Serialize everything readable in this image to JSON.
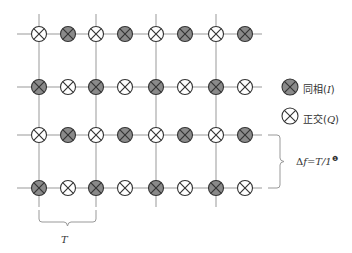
{
  "diagram": {
    "grid": {
      "row_y": [
        34,
        87,
        135,
        188
      ],
      "col_x": [
        39,
        68,
        96,
        125,
        156,
        185,
        216,
        245
      ],
      "vertical_line_x": [
        39,
        96,
        156,
        216
      ],
      "h_line_start": 17,
      "h_line_end": 262,
      "v_line_top": 14,
      "v_line_bottom": 207,
      "symbol_radius": 7.5,
      "rows": [
        [
          "Q",
          "I",
          "Q",
          "I",
          "Q",
          "I",
          "Q",
          "I"
        ],
        [
          "I",
          "Q",
          "I",
          "Q",
          "I",
          "Q",
          "I",
          "Q"
        ],
        [
          "Q",
          "I",
          "Q",
          "I",
          "Q",
          "I",
          "Q",
          "I"
        ],
        [
          "I",
          "Q",
          "I",
          "Q",
          "I",
          "Q",
          "I",
          "Q"
        ]
      ]
    },
    "colors": {
      "line": "#999999",
      "symbol_stroke": "#333333",
      "inphase_fill": "#8a8a8a",
      "quadrature_fill": "#ffffff",
      "text": "#333333"
    },
    "legend": {
      "items": [
        {
          "kind": "I",
          "label_prefix": "同相(",
          "label_var": "I",
          "label_suffix": ")",
          "icon": "filled-cross-circle-icon"
        },
        {
          "kind": "Q",
          "label_prefix": "正交(",
          "label_var": "Q",
          "label_suffix": ")",
          "icon": "hollow-cross-circle-icon"
        }
      ]
    },
    "brace_right": {
      "formula_delta": "Δ",
      "formula_var": "f",
      "formula_rest": "=T/1",
      "footnote_marker": "❶"
    },
    "brace_bottom": {
      "label": "T"
    }
  }
}
